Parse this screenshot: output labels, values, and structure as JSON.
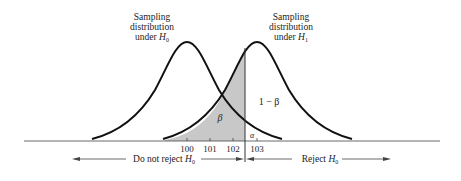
{
  "labels": {
    "h0_title_line1": "Sampling",
    "h0_title_line2": "distribution",
    "h0_title_line3_prefix": "under ",
    "h0_title_var": "H",
    "h0_title_sub": "0",
    "h1_title_line1": "Sampling",
    "h1_title_line2": "distribution",
    "h1_title_line3_prefix": "under ",
    "h1_title_var": "H",
    "h1_title_sub": "1",
    "beta": "β",
    "one_minus_beta": "1 − β",
    "alpha": "α",
    "do_not_reject_prefix": "Do not reject ",
    "reject_prefix": "Reject ",
    "hyp_var": "H",
    "hyp_sub": "0"
  },
  "axis": {
    "ticks": [
      "100",
      "101",
      "102",
      "103"
    ]
  },
  "colors": {
    "curve": "#111111",
    "shade": "#c8c8c8",
    "axis": "#444444"
  }
}
